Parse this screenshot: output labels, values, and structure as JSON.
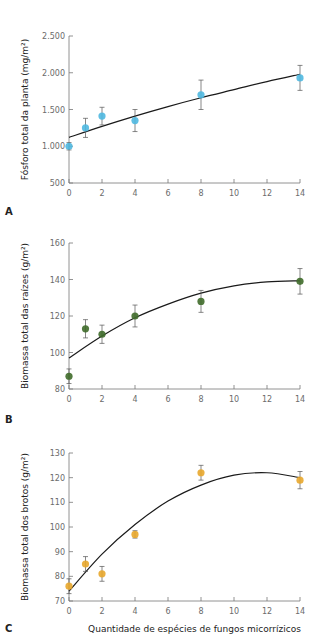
{
  "chart_data": [
    {
      "type": "scatter",
      "panel": "A",
      "title": "",
      "xlabel": "",
      "ylabel": "Fósforo total da planta (mg/m²)",
      "xlim": [
        0,
        14
      ],
      "ylim": [
        500,
        2500
      ],
      "x_ticks": [
        0,
        2,
        4,
        6,
        8,
        10,
        12,
        14
      ],
      "y_ticks": [
        500,
        1000,
        1500,
        2000,
        2500
      ],
      "y_tick_labels": [
        "500",
        "1.000",
        "1.500",
        "2.000",
        "2.500"
      ],
      "point_color": "#4fb8e0",
      "grid": false,
      "points": [
        {
          "x": 0,
          "y": 1000,
          "err": 50
        },
        {
          "x": 1,
          "y": 1250,
          "err": 130
        },
        {
          "x": 2,
          "y": 1410,
          "err": 120
        },
        {
          "x": 4,
          "y": 1350,
          "err": 150
        },
        {
          "x": 8,
          "y": 1700,
          "err": 200
        },
        {
          "x": 14,
          "y": 1930,
          "err": 170
        }
      ],
      "fit": {
        "type": "curve",
        "x": [
          0,
          2,
          4,
          6,
          8,
          10,
          12,
          14
        ],
        "y": [
          1120,
          1270,
          1410,
          1540,
          1660,
          1770,
          1880,
          1980
        ]
      }
    },
    {
      "type": "scatter",
      "panel": "B",
      "title": "",
      "xlabel": "",
      "ylabel": "Biomassa total das raízes (g/m²)",
      "xlim": [
        0,
        14
      ],
      "ylim": [
        80,
        160
      ],
      "x_ticks": [
        0,
        2,
        4,
        6,
        8,
        10,
        12,
        14
      ],
      "y_ticks": [
        80,
        100,
        120,
        140,
        160
      ],
      "y_tick_labels": [
        "80",
        "100",
        "120",
        "140",
        "160"
      ],
      "point_color": "#3f6b2a",
      "grid": false,
      "points": [
        {
          "x": 0,
          "y": 87,
          "err": 4
        },
        {
          "x": 1,
          "y": 113,
          "err": 5
        },
        {
          "x": 2,
          "y": 110,
          "err": 5
        },
        {
          "x": 4,
          "y": 120,
          "err": 6
        },
        {
          "x": 8,
          "y": 128,
          "err": 6
        },
        {
          "x": 14,
          "y": 139,
          "err": 7
        }
      ],
      "fit": {
        "type": "curve",
        "x": [
          0,
          2,
          4,
          6,
          8,
          10,
          12,
          14
        ],
        "y": [
          97,
          109,
          119,
          126.5,
          132.5,
          136.5,
          138.7,
          139.3
        ]
      }
    },
    {
      "type": "scatter",
      "panel": "C",
      "title": "",
      "xlabel": "Quantidade de espécies de fungos micorrízicos",
      "ylabel": "Biomassa total dos brotos (g/m²)",
      "xlim": [
        0,
        14
      ],
      "ylim": [
        70,
        130
      ],
      "x_ticks": [
        0,
        2,
        4,
        6,
        8,
        10,
        12,
        14
      ],
      "y_ticks": [
        70,
        80,
        90,
        100,
        110,
        120,
        130
      ],
      "y_tick_labels": [
        "70",
        "80",
        "90",
        "100",
        "110",
        "120",
        "130"
      ],
      "point_color": "#e8a72c",
      "grid": false,
      "points": [
        {
          "x": 0,
          "y": 76,
          "err": 3
        },
        {
          "x": 1,
          "y": 85,
          "err": 3
        },
        {
          "x": 2,
          "y": 81,
          "err": 3
        },
        {
          "x": 4,
          "y": 97,
          "err": 1.5
        },
        {
          "x": 8,
          "y": 122,
          "err": 3
        },
        {
          "x": 14,
          "y": 119,
          "err": 3.5
        }
      ],
      "fit": {
        "type": "curve",
        "x": [
          0,
          2,
          4,
          6,
          8,
          10,
          12,
          14
        ],
        "y": [
          74,
          89,
          101,
          110.5,
          117,
          121,
          122,
          120
        ]
      }
    }
  ],
  "panels": {
    "a": {
      "label": "A"
    },
    "b": {
      "label": "B"
    },
    "c": {
      "label": "C"
    }
  },
  "shared_xlabel": "Quantidade de espécies de fungos micorrízicos"
}
